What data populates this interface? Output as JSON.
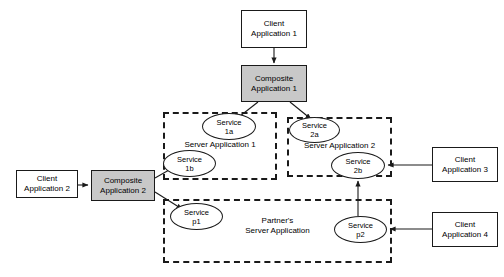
{
  "diagram": {
    "colors": {
      "composite_fill": "#c8c8c8",
      "node_fill": "#ffffff",
      "stroke": "#1a1a1a",
      "background": "#ffffff"
    },
    "nodes": [
      {
        "id": "client1",
        "label": "Client\nApplication 1",
        "type": "client",
        "x": 241,
        "y": 10,
        "w": 66,
        "h": 38
      },
      {
        "id": "composite1",
        "label": "Composite\nApplication 1",
        "type": "composite",
        "x": 241,
        "y": 65,
        "w": 66,
        "h": 37
      },
      {
        "id": "client2",
        "label": "Client\nApplication 2",
        "type": "client",
        "x": 16,
        "y": 170,
        "w": 62,
        "h": 28
      },
      {
        "id": "composite2",
        "label": "Composite\nApplication 2",
        "type": "composite",
        "x": 91,
        "y": 170,
        "w": 64,
        "h": 31
      },
      {
        "id": "client3",
        "label": "Client\nApplication 3",
        "type": "client",
        "x": 432,
        "y": 147,
        "w": 66,
        "h": 35
      },
      {
        "id": "client4",
        "label": "Client\nApplication 4",
        "type": "client",
        "x": 432,
        "y": 212,
        "w": 66,
        "h": 35
      }
    ],
    "containers": [
      {
        "id": "server1",
        "label": "Server Application 1",
        "x": 163,
        "y": 112,
        "w": 114,
        "h": 68,
        "label_x": 163,
        "label_y": 140,
        "label_w": 114
      },
      {
        "id": "server2",
        "label": "Server Application 2",
        "x": 287,
        "y": 117,
        "w": 105,
        "h": 60,
        "label_x": 287,
        "label_y": 141,
        "label_w": 105
      },
      {
        "id": "partner",
        "label": "Partner's\nServer Application",
        "x": 163,
        "y": 199,
        "w": 229,
        "h": 64,
        "label_x": 210,
        "label_y": 216,
        "label_w": 135
      }
    ],
    "services": [
      {
        "id": "s1a",
        "label": "Service\n1a",
        "x": 202,
        "y": 113,
        "w": 54,
        "h": 27
      },
      {
        "id": "s1b",
        "label": "Service\n1b",
        "x": 163,
        "y": 150,
        "w": 53,
        "h": 27
      },
      {
        "id": "s2a",
        "label": "Service\n2a",
        "x": 289,
        "y": 117,
        "w": 51,
        "h": 26
      },
      {
        "id": "s2b",
        "label": "Service\n2b",
        "x": 331,
        "y": 152,
        "w": 54,
        "h": 27
      },
      {
        "id": "sp1",
        "label": "Service\np1",
        "x": 170,
        "y": 203,
        "w": 53,
        "h": 27
      },
      {
        "id": "sp2",
        "label": "Service\np2",
        "x": 334,
        "y": 216,
        "w": 53,
        "h": 27
      }
    ],
    "edges": [
      {
        "id": "e-client1-composite1",
        "from": "client1",
        "to": "composite1",
        "path": "M274,48 L274,63",
        "arrow_at": "274,64"
      },
      {
        "id": "e-composite1-s1a",
        "from": "composite1",
        "to": "s1a",
        "path": "M258,102 L235,120",
        "arrow_at": "234,121"
      },
      {
        "id": "e-composite1-s2a",
        "from": "composite1",
        "to": "s2a",
        "path": "M290,102 L311,119",
        "arrow_at": "312,120"
      },
      {
        "id": "e-client2-composite2",
        "from": "client2",
        "to": "composite2",
        "path": "M78,185 L88,185",
        "arrow_at": "89,185"
      },
      {
        "id": "e-composite2-s1b",
        "from": "composite2",
        "to": "s1b",
        "path": "M155,178 L176,166",
        "arrow_at": "177,165"
      },
      {
        "id": "e-composite2-sp1",
        "from": "composite2",
        "to": "sp1",
        "path": "M155,192 L182,209",
        "arrow_at": "183,210"
      },
      {
        "id": "e-client3-s2b",
        "from": "client3",
        "to": "s2b",
        "path": "M432,165 L388,165",
        "arrow_at": "387,165"
      },
      {
        "id": "e-client4-sp2",
        "from": "client4",
        "to": "sp2",
        "path": "M432,229 L390,229",
        "arrow_at": "389,229"
      },
      {
        "id": "e-sp2-s2b",
        "from": "sp2",
        "to": "s2b",
        "path": "M358,216 L358,181",
        "arrow_at": "358,180"
      }
    ]
  }
}
